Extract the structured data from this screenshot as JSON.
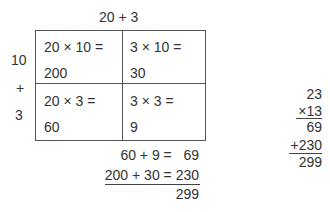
{
  "top_label": "20 + 3",
  "side_labels": {
    "ten": "10",
    "plus": "+",
    "three": "3"
  },
  "grid": {
    "cells": [
      {
        "expr": "20 × 10 =",
        "result": "200"
      },
      {
        "expr": "3 × 10 =",
        "result": "30"
      },
      {
        "expr": "20 × 3 =",
        "result": "60"
      },
      {
        "expr": "3 × 3 =",
        "result": "9"
      }
    ]
  },
  "sums": {
    "line1": "60 + 9 =   69",
    "line2": "200 + 30 = 230",
    "total": "299"
  },
  "column_method": {
    "multiplicand": "23",
    "multiplier": "×13",
    "partial1": "69",
    "partial2": "+230",
    "total": "299"
  }
}
